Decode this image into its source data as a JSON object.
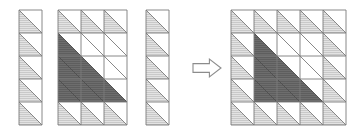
{
  "figure": {
    "type": "diagram",
    "background": "#ffffff",
    "cell_size": 23,
    "diagonal": "anti-diagonal (top-right to bottom-left)",
    "colors": {
      "white": "#ffffff",
      "light_gray": "#e3e3e3",
      "dark_gray": "#5e5e5e",
      "stroke": "#7a7a7a",
      "stroke_dark": "#4a4a4a",
      "hatch": "#c9c9c9"
    },
    "legend_note": "lower-left triangle of each cell is the 'first' triangle; upper-right triangle is the 'second' triangle"
  },
  "panels": [
    {
      "id": "panel-a",
      "name": "left-column-grid",
      "x": 19,
      "y": 10,
      "cols": 1,
      "rows": 5,
      "cells": [
        [
          {
            "lower": "light",
            "upper": "white"
          }
        ],
        [
          {
            "lower": "light",
            "upper": "white"
          }
        ],
        [
          {
            "lower": "light",
            "upper": "white"
          }
        ],
        [
          {
            "lower": "light",
            "upper": "white"
          }
        ],
        [
          {
            "lower": "light",
            "upper": "white"
          }
        ]
      ]
    },
    {
      "id": "panel-b",
      "name": "middle-three-column-grid",
      "x": 58,
      "y": 10,
      "cols": 3,
      "rows": 5,
      "cells": [
        [
          {
            "lower": "light",
            "upper": "white"
          },
          {
            "lower": "light",
            "upper": "white"
          },
          {
            "lower": "light",
            "upper": "white"
          }
        ],
        [
          {
            "lower": "dark",
            "upper": "white"
          },
          {
            "lower": "white",
            "upper": "white"
          },
          {
            "lower": "white",
            "upper": "white"
          }
        ],
        [
          {
            "lower": "dark",
            "upper": "dark"
          },
          {
            "lower": "dark",
            "upper": "white"
          },
          {
            "lower": "white",
            "upper": "white"
          }
        ],
        [
          {
            "lower": "dark",
            "upper": "dark"
          },
          {
            "lower": "dark",
            "upper": "dark"
          },
          {
            "lower": "dark",
            "upper": "white"
          }
        ],
        [
          {
            "lower": "light",
            "upper": "white"
          },
          {
            "lower": "light",
            "upper": "white"
          },
          {
            "lower": "light",
            "upper": "white"
          }
        ]
      ]
    },
    {
      "id": "panel-c",
      "name": "right-column-grid",
      "x": 146,
      "y": 10,
      "cols": 1,
      "rows": 5,
      "cells": [
        [
          {
            "lower": "light",
            "upper": "white"
          }
        ],
        [
          {
            "lower": "light",
            "upper": "white"
          }
        ],
        [
          {
            "lower": "light",
            "upper": "white"
          }
        ],
        [
          {
            "lower": "light",
            "upper": "white"
          }
        ],
        [
          {
            "lower": "light",
            "upper": "white"
          }
        ]
      ]
    },
    {
      "id": "panel-d",
      "name": "result-five-by-five-grid",
      "x": 231,
      "y": 10,
      "cols": 5,
      "rows": 5,
      "cells": [
        [
          {
            "lower": "light",
            "upper": "white"
          },
          {
            "lower": "light",
            "upper": "white"
          },
          {
            "lower": "light",
            "upper": "white"
          },
          {
            "lower": "light",
            "upper": "white"
          },
          {
            "lower": "light",
            "upper": "white"
          }
        ],
        [
          {
            "lower": "light",
            "upper": "white"
          },
          {
            "lower": "dark",
            "upper": "white"
          },
          {
            "lower": "white",
            "upper": "white"
          },
          {
            "lower": "white",
            "upper": "white"
          },
          {
            "lower": "light",
            "upper": "white"
          }
        ],
        [
          {
            "lower": "light",
            "upper": "white"
          },
          {
            "lower": "dark",
            "upper": "dark"
          },
          {
            "lower": "dark",
            "upper": "white"
          },
          {
            "lower": "white",
            "upper": "white"
          },
          {
            "lower": "light",
            "upper": "white"
          }
        ],
        [
          {
            "lower": "light",
            "upper": "white"
          },
          {
            "lower": "dark",
            "upper": "dark"
          },
          {
            "lower": "dark",
            "upper": "dark"
          },
          {
            "lower": "dark",
            "upper": "white"
          },
          {
            "lower": "light",
            "upper": "white"
          }
        ],
        [
          {
            "lower": "light",
            "upper": "white"
          },
          {
            "lower": "light",
            "upper": "white"
          },
          {
            "lower": "light",
            "upper": "white"
          },
          {
            "lower": "light",
            "upper": "white"
          },
          {
            "lower": "light",
            "upper": "white"
          }
        ]
      ]
    }
  ],
  "arrow": {
    "name": "right-arrow",
    "glyph": "⇨",
    "x": 192,
    "y": 58,
    "width": 30,
    "height": 20,
    "fill": "#ffffff",
    "stroke": "#8c8c8c",
    "label": ""
  }
}
